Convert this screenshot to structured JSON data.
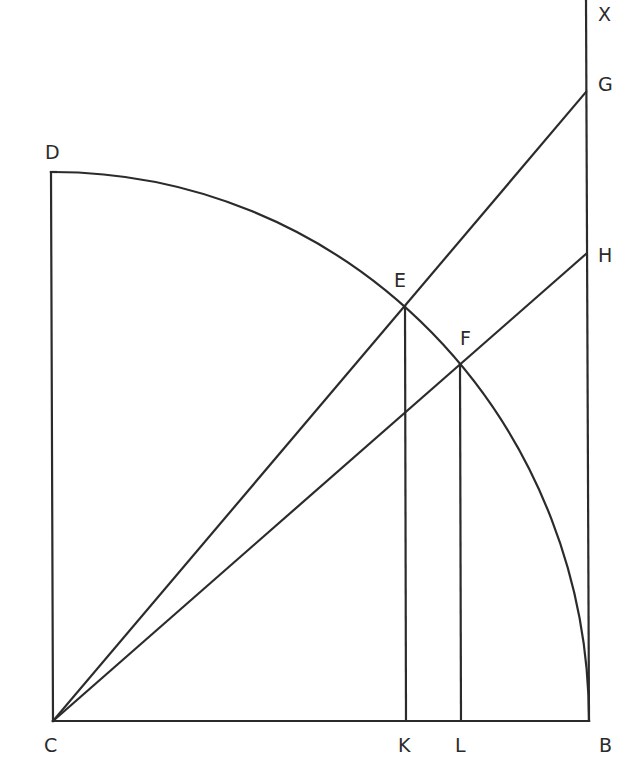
{
  "diagram": {
    "type": "geometric construction",
    "points": {
      "C": {
        "label": "C",
        "x": 53,
        "y": 721,
        "label_x": 44,
        "label_y": 752
      },
      "B": {
        "label": "B",
        "x": 589,
        "y": 721,
        "label_x": 599,
        "label_y": 752
      },
      "D": {
        "label": "D",
        "x": 51,
        "y": 172,
        "label_x": 46,
        "label_y": 159
      },
      "E": {
        "label": "E",
        "x": 405,
        "y": 306,
        "label_x": 394,
        "label_y": 287
      },
      "F": {
        "label": "F",
        "x": 460,
        "y": 364,
        "label_x": 460,
        "label_y": 345
      },
      "G": {
        "label": "G",
        "x": 586,
        "y": 92,
        "label_x": 598,
        "label_y": 91
      },
      "H": {
        "label": "H",
        "x": 586,
        "y": 254,
        "label_x": 598,
        "label_y": 262
      },
      "K": {
        "label": "K",
        "x": 406,
        "y": 721,
        "label_x": 398,
        "label_y": 752
      },
      "L": {
        "label": "L",
        "x": 461,
        "y": 721,
        "label_x": 455,
        "label_y": 752
      },
      "X": {
        "label": "X",
        "x": 586,
        "y": 0,
        "label_x": 598,
        "label_y": 21
      }
    },
    "segments": [
      {
        "name": "CD",
        "from": "C",
        "to": "D"
      },
      {
        "name": "CB",
        "from": "C",
        "to": "B"
      },
      {
        "name": "BX",
        "from": "B",
        "to": "X"
      },
      {
        "name": "CG",
        "from": "C",
        "to": "G"
      },
      {
        "name": "CH",
        "from": "C",
        "to": "H"
      },
      {
        "name": "EK",
        "from": "E",
        "to": "K"
      },
      {
        "name": "FL",
        "from": "F",
        "to": "L"
      }
    ],
    "arcs": [
      {
        "name": "arc-DB",
        "center": "C",
        "from": "D",
        "to": "B"
      }
    ],
    "stroke_color": "#2b2b2b",
    "background_color": "#ffffff"
  }
}
